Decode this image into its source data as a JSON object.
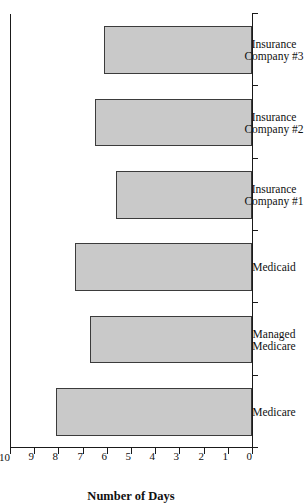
{
  "chart_data": {
    "type": "bar",
    "orientation": "vertical-rotated-90",
    "title": "",
    "xlabel": "",
    "ylabel": "Number of Days",
    "ylim": [
      0,
      10
    ],
    "ytick_labels": [
      "0",
      "1",
      "2",
      "3",
      "4",
      "5",
      "6",
      "7",
      "8",
      "9",
      "10"
    ],
    "ytick_values": [
      0,
      1,
      2,
      3,
      4,
      5,
      6,
      7,
      8,
      9,
      10
    ],
    "grid": false,
    "legend": null,
    "categories": [
      "Medicare",
      "Managed Medicare",
      "Medicaid",
      "Insurance Company #1",
      "Insurance Company #2",
      "Insurance Company #3"
    ],
    "category_label_lines": [
      [
        "Medicare"
      ],
      [
        "Managed",
        "Medicare"
      ],
      [
        "Medicaid"
      ],
      [
        "Insurance",
        "Company #1"
      ],
      [
        "Insurance",
        "Company #2"
      ],
      [
        "Insurance",
        "Company #3"
      ]
    ],
    "values": [
      8.1,
      6.7,
      7.3,
      5.6,
      6.5,
      6.1
    ],
    "bar_fill_color": "#c9c9c9",
    "bar_edge_color": "#3b3b3b",
    "axis_color": "#1a1a1a",
    "background_color": "#ffffff"
  }
}
